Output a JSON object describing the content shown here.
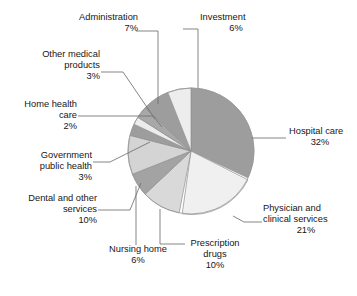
{
  "chart_data": {
    "type": "pie",
    "title": "",
    "xlabel": "",
    "ylabel": "",
    "legend_position": "none",
    "grid": false,
    "value_suffix": "%",
    "total": 100,
    "start_angle_deg": 0,
    "direction": "clockwise",
    "categories": [
      "Hospital care",
      "Physician and clinical services",
      "Prescription drugs",
      "Nursing home",
      "Dental and other services",
      "Government public health",
      "Home health care",
      "Other medical products",
      "Administration",
      "Investment"
    ],
    "values": [
      32,
      21,
      10,
      6,
      10,
      3,
      2,
      3,
      7,
      6
    ],
    "slices": [
      {
        "label": "Hospital care",
        "value": 32,
        "value_text": "32%",
        "color": "#9d9d9d"
      },
      {
        "label": "Physician and clinical services",
        "value": 21,
        "value_text": "21%",
        "color": "#f0f0f0"
      },
      {
        "label": "Prescription drugs",
        "value": 10,
        "value_text": "10%",
        "color": "#d9d9d9"
      },
      {
        "label": "Nursing home",
        "value": 6,
        "value_text": "6%",
        "color": "#a3a3a3"
      },
      {
        "label": "Dental and other services",
        "value": 10,
        "value_text": "10%",
        "color": "#d4d4d4"
      },
      {
        "label": "Government public health",
        "value": 3,
        "value_text": "3%",
        "color": "#9d9d9d"
      },
      {
        "label": "Home health care",
        "value": 2,
        "value_text": "2%",
        "color": "#ececec"
      },
      {
        "label": "Other medical products",
        "value": 3,
        "value_text": "3%",
        "color": "#a8a8a8"
      },
      {
        "label": "Administration",
        "value": 7,
        "value_text": "7%",
        "color": "#9d9d9d"
      },
      {
        "label": "Investment",
        "value": 6,
        "value_text": "6%",
        "color": "#ededed"
      }
    ]
  },
  "labels": {
    "administration": {
      "line1": "Administration",
      "line2": "",
      "pct": "7%"
    },
    "investment": {
      "line1": "Investment",
      "line2": "",
      "pct": "6%"
    },
    "other_medical": {
      "line1": "Other medical",
      "line2": "products",
      "pct": "3%"
    },
    "home_health": {
      "line1": "Home health",
      "line2": "care",
      "pct": "2%"
    },
    "gov_public": {
      "line1": "Government",
      "line2": "public health",
      "pct": "3%"
    },
    "dental": {
      "line1": "Dental and other",
      "line2": "services",
      "pct": "10%"
    },
    "nursing_home": {
      "line1": "Nursing home",
      "line2": "",
      "pct": "6%"
    },
    "prescription": {
      "line1": "Prescription",
      "line2": "drugs",
      "pct": "10%"
    },
    "physician": {
      "line1": "Physician and",
      "line2": "clinical services",
      "pct": "21%"
    },
    "hospital": {
      "line1": "Hospital care",
      "line2": "",
      "pct": "32%"
    }
  },
  "style": {
    "background": "#ffffff",
    "text_color": "#161616",
    "leader_line_color": "#6f6f6f",
    "pie_outline": "#8f8f8f"
  }
}
